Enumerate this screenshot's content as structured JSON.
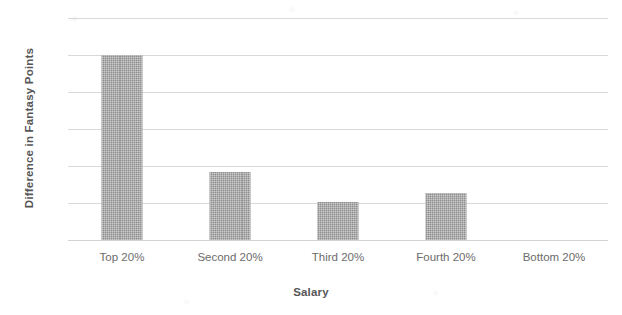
{
  "chart_data": {
    "type": "bar",
    "title": "",
    "subtitle": "",
    "xlabel": "Salary",
    "ylabel": "Difference in Fantasy Points",
    "categories": [
      "Top 20%",
      "Second 20%",
      "Third 20%",
      "Fourth 20%",
      "Bottom 20%"
    ],
    "values": [
      2.5,
      0.92,
      0.52,
      0.64,
      0
    ],
    "ylim": [
      0,
      3
    ],
    "ytick_labels": [
      "3",
      "2.5",
      "2",
      "1.5",
      "1",
      "0.5",
      "0"
    ],
    "ytick_values": [
      3,
      2.5,
      2,
      1.5,
      1,
      0.5,
      0
    ],
    "grid": true,
    "legend": "none",
    "bar_color": "#8e8e8e",
    "gridline_color": "#d9d9d9",
    "text_color": "#6b6b6b"
  }
}
